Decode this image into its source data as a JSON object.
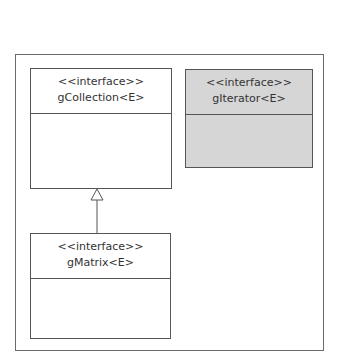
{
  "diagram": {
    "type": "uml-class-diagram",
    "classes": [
      {
        "id": "gCollection",
        "stereotype": "<<interface>>",
        "name": "gCollection<E>",
        "shaded": false
      },
      {
        "id": "gIterator",
        "stereotype": "<<interface>>",
        "name": "gIterator<E>",
        "shaded": true
      },
      {
        "id": "gMatrix",
        "stereotype": "<<interface>>",
        "name": "gMatrix<E>",
        "shaded": false
      }
    ],
    "relationships": [
      {
        "type": "generalization",
        "from": "gMatrix",
        "to": "gCollection"
      }
    ],
    "colors": {
      "line": "#555555",
      "frame": "#6a6a6a",
      "shaded_fill": "#d6d6d6",
      "text": "#333333"
    }
  }
}
